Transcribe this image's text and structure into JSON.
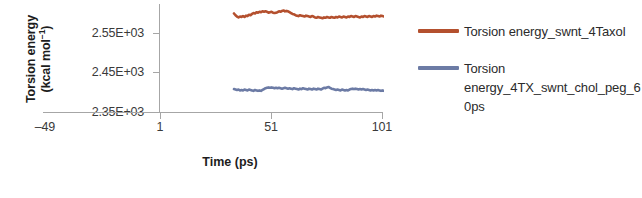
{
  "chart_data": {
    "type": "line",
    "title": "",
    "xlabel": "Time (ps)",
    "ylabel_line1": "Torsion energy",
    "ylabel_line2_prefix": "(kcal mol",
    "ylabel_line2_sup": "−1",
    "ylabel_line2_suffix": ")",
    "ylabel_full": "Torsion energy (kcal mol−1)",
    "xtick_labels": [
      "–49",
      "1",
      "51",
      "101"
    ],
    "xtick_values": [
      -49,
      1,
      51,
      101
    ],
    "ytick_labels": [
      "2.55E+03",
      "2.45E+03",
      "2.35E+03"
    ],
    "ytick_values": [
      2550,
      2450,
      2350
    ],
    "xlim": [
      -49,
      101
    ],
    "ylim": [
      2350,
      2600
    ],
    "grid": false,
    "legend_position": "right",
    "series": [
      {
        "name": "Torsion energy_swnt_4Taxol",
        "color": "#B4502E",
        "x": [
          1,
          2,
          3,
          4,
          5,
          6,
          7,
          8,
          9,
          10,
          11,
          12,
          13,
          14,
          15,
          16,
          17,
          18,
          19,
          20,
          21,
          22,
          23,
          24,
          25,
          26,
          27,
          28,
          29,
          30,
          31,
          32,
          33,
          34,
          35,
          36,
          37,
          38,
          39,
          40,
          41,
          42,
          43,
          44,
          45,
          46,
          47,
          48,
          49,
          50,
          51,
          52,
          53,
          54,
          55,
          56,
          57,
          58,
          59,
          60,
          61,
          62,
          63,
          64,
          65,
          66,
          67,
          68,
          69,
          70,
          71,
          72,
          73,
          74,
          75,
          76,
          77,
          78,
          79,
          80,
          81,
          82,
          83,
          84,
          85,
          86,
          87,
          88,
          89,
          90,
          91,
          92,
          93,
          94,
          95,
          96,
          97,
          98,
          99,
          100,
          101
        ],
        "values": [
          2578,
          2574,
          2571,
          2569,
          2571,
          2570,
          2572,
          2570,
          2573,
          2572,
          2575,
          2574,
          2577,
          2579,
          2578,
          2581,
          2580,
          2582,
          2581,
          2583,
          2582,
          2583,
          2582,
          2580,
          2581,
          2582,
          2580,
          2579,
          2580,
          2581,
          2583,
          2582,
          2584,
          2585,
          2583,
          2584,
          2583,
          2581,
          2579,
          2577,
          2576,
          2574,
          2573,
          2572,
          2574,
          2573,
          2572,
          2571,
          2573,
          2572,
          2571,
          2570,
          2572,
          2571,
          2569,
          2568,
          2570,
          2569,
          2568,
          2567,
          2569,
          2568,
          2570,
          2569,
          2568,
          2570,
          2569,
          2568,
          2570,
          2569,
          2571,
          2570,
          2569,
          2571,
          2570,
          2569,
          2571,
          2570,
          2572,
          2571,
          2570,
          2572,
          2571,
          2570,
          2569,
          2571,
          2570,
          2572,
          2571,
          2570,
          2572,
          2571,
          2570,
          2572,
          2571,
          2573,
          2572,
          2571,
          2573,
          2572,
          2571
        ]
      },
      {
        "name": "Torsion energy_4TX_swnt_chol_peg_60ps",
        "color": "#6C7BA5",
        "x": [
          1,
          2,
          3,
          4,
          5,
          6,
          7,
          8,
          9,
          10,
          11,
          12,
          13,
          14,
          15,
          16,
          17,
          18,
          19,
          20,
          21,
          22,
          23,
          24,
          25,
          26,
          27,
          28,
          29,
          30,
          31,
          32,
          33,
          34,
          35,
          36,
          37,
          38,
          39,
          40,
          41,
          42,
          43,
          44,
          45,
          46,
          47,
          48,
          49,
          50,
          51,
          52,
          53,
          54,
          55,
          56,
          57,
          58,
          59,
          60,
          61,
          62,
          63,
          64,
          65,
          66,
          67,
          68,
          69,
          70,
          71,
          72,
          73,
          74,
          75,
          76,
          77,
          78,
          79,
          80,
          81,
          82,
          83,
          84,
          85,
          86,
          87,
          88,
          89,
          90,
          91,
          92,
          93,
          94,
          95,
          96,
          97,
          98,
          99,
          100,
          101
        ],
        "values": [
          2403,
          2402,
          2401,
          2402,
          2400,
          2401,
          2400,
          2402,
          2401,
          2400,
          2402,
          2401,
          2400,
          2399,
          2401,
          2400,
          2399,
          2400,
          2399,
          2401,
          2403,
          2405,
          2406,
          2407,
          2406,
          2407,
          2406,
          2405,
          2406,
          2405,
          2406,
          2405,
          2404,
          2405,
          2406,
          2405,
          2404,
          2405,
          2404,
          2403,
          2405,
          2404,
          2403,
          2402,
          2404,
          2403,
          2405,
          2404,
          2403,
          2402,
          2404,
          2403,
          2402,
          2404,
          2403,
          2402,
          2404,
          2403,
          2402,
          2404,
          2406,
          2405,
          2407,
          2408,
          2406,
          2404,
          2403,
          2402,
          2401,
          2402,
          2401,
          2400,
          2402,
          2401,
          2400,
          2401,
          2400,
          2402,
          2403,
          2404,
          2403,
          2404,
          2403,
          2402,
          2403,
          2402,
          2403,
          2402,
          2401,
          2402,
          2401,
          2400,
          2401,
          2400,
          2401,
          2400,
          2401,
          2400,
          2399,
          2400,
          2399
        ]
      }
    ]
  },
  "legend": {
    "items": [
      {
        "label": "Torsion energy_swnt_4Taxol",
        "color": "#B4502E"
      },
      {
        "label": "Torsion energy_4TX_swnt_chol_peg_60ps",
        "color": "#6C7BA5"
      }
    ]
  }
}
